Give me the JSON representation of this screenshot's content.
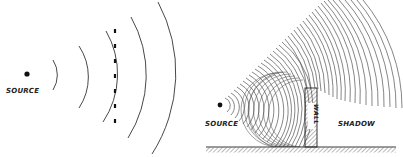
{
  "figure": {
    "left_panel": {
      "source_label": "SOURCE",
      "source": {
        "x": 27,
        "y": 74
      },
      "wavefront_radii": [
        28,
        56,
        86,
        118,
        150
      ],
      "barrier": {
        "type": "dashed-line",
        "x": 115,
        "y1": 30,
        "y2": 126
      }
    },
    "right_panel": {
      "source_label": "SOURCE",
      "wall_label": "WALL",
      "shadow_label": "SHADOW",
      "source": {
        "x": 220,
        "y": 105
      },
      "wall": {
        "x": 305,
        "y": 88,
        "width": 12,
        "height": 59
      },
      "ground_y": 147
    },
    "colors": {
      "ink": "#222222",
      "background": "#ffffff"
    }
  }
}
